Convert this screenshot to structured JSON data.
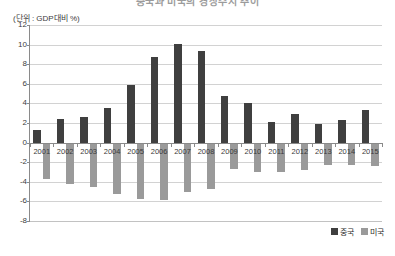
{
  "title": "중국과 미국의 경상수지 추이",
  "unit_label": "(단위 : GDP대비 %)",
  "legend": {
    "position": "bottom-right",
    "entries": [
      {
        "label": "중국",
        "color": "#3f3f3f"
      },
      {
        "label": "미국",
        "color": "#9a9a9a"
      }
    ]
  },
  "colors": {
    "china": "#3f3f3f",
    "usa": "#9a9a9a",
    "gridline": "#d2d2d2",
    "axis": "#8a8a8a",
    "background": "#ffffff"
  },
  "chart_data": {
    "type": "bar",
    "title": "중국과 미국의 경상수지 추이",
    "xlabel": "",
    "ylabel": "(단위 : GDP대비 %)",
    "ylim": [
      -8,
      12
    ],
    "yticks": [
      12,
      10,
      8,
      6,
      4,
      2,
      0,
      -2,
      -4,
      -6,
      -8
    ],
    "grid": true,
    "categories": [
      "2001",
      "2002",
      "2003",
      "2004",
      "2005",
      "2006",
      "2007",
      "2008",
      "2009",
      "2010",
      "2011",
      "2012",
      "2013",
      "2014",
      "2015"
    ],
    "series": [
      {
        "name": "중국",
        "color": "#3f3f3f",
        "values": [
          1.3,
          2.4,
          2.6,
          3.5,
          5.9,
          8.7,
          10.1,
          9.3,
          4.8,
          4.0,
          2.1,
          2.9,
          1.9,
          2.3,
          3.3
        ]
      },
      {
        "name": "미국",
        "color": "#9a9a9a",
        "values": [
          -3.7,
          -4.2,
          -4.5,
          -5.2,
          -5.8,
          -5.9,
          -5.0,
          -4.7,
          -2.7,
          -3.0,
          -3.0,
          -2.8,
          -2.3,
          -2.3,
          -2.4
        ]
      }
    ]
  }
}
